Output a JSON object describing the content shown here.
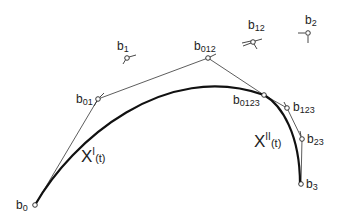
{
  "diagram": {
    "title": "",
    "colors": {
      "stroke": "#222222",
      "background": "#ffffff"
    },
    "points": [
      {
        "id": "b0",
        "base": "b",
        "sub": "0",
        "x": 35,
        "y": 205
      },
      {
        "id": "b01",
        "base": "b",
        "sub": "01",
        "x": 98,
        "y": 99
      },
      {
        "id": "b1",
        "base": "b",
        "sub": "1",
        "x": 127,
        "y": 58
      },
      {
        "id": "b012",
        "base": "b",
        "sub": "012",
        "x": 208,
        "y": 58
      },
      {
        "id": "b12",
        "base": "b",
        "sub": "12",
        "x": 253,
        "y": 42
      },
      {
        "id": "b2",
        "base": "b",
        "sub": "2",
        "x": 308,
        "y": 33
      },
      {
        "id": "b0123",
        "base": "b",
        "sub": "0123",
        "x": 264,
        "y": 95
      },
      {
        "id": "b123",
        "base": "b",
        "sub": "123",
        "x": 287,
        "y": 108
      },
      {
        "id": "b23",
        "base": "b",
        "sub": "23",
        "x": 302,
        "y": 139
      },
      {
        "id": "b3",
        "base": "b",
        "sub": "3",
        "x": 301,
        "y": 184
      }
    ],
    "curves": [
      {
        "id": "curve-I",
        "label_base": "X",
        "label_sup": "I",
        "label_arg": "(t)"
      },
      {
        "id": "curve-II",
        "label_base": "X",
        "label_sup": "II",
        "label_arg": "(t)"
      }
    ]
  }
}
